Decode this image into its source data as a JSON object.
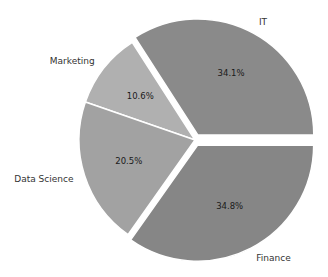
{
  "chart_data": {
    "type": "pie",
    "title": "",
    "categories": [
      "IT",
      "Marketing",
      "Data Science",
      "Finance"
    ],
    "values": [
      34.1,
      10.6,
      20.5,
      34.8
    ],
    "value_labels": [
      "34.1%",
      "10.6%",
      "20.5%",
      "34.8%"
    ],
    "colors": [
      "#8a8a8a",
      "#b0b0b0",
      "#a2a2a2",
      "#868686"
    ],
    "explode": [
      0.05,
      0,
      0,
      0.05
    ],
    "start_angle": 0,
    "direction": "counterclockwise",
    "legend": false
  },
  "pie": {
    "center_x": 195,
    "center_y": 140,
    "radius": 116,
    "edge_color": "#ffffff"
  }
}
